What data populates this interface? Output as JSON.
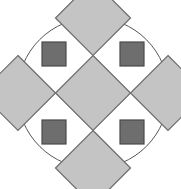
{
  "figure": {
    "title": "Geometric tile pattern",
    "description": "A circle containing five light gray diamonds arranged in a quincunx and four dark gray squares at the diagonal corners",
    "background_color": "#ffffff",
    "canvas": {
      "width": 181,
      "height": 189
    }
  },
  "palette": {
    "circle_stroke": "#555555",
    "circle_fill": "#ffffff",
    "diamond_fill": "#c4c4c4",
    "diamond_stroke": "#6b6b6b",
    "square_fill": "#6e6e6e",
    "square_stroke": "#4a4a4a"
  },
  "geometry": {
    "circle": {
      "cx": 93,
      "cy": 93,
      "r": 75.5,
      "stroke_width": 1
    },
    "diamond_half_diagonal": 37.5,
    "square_size": 24,
    "stroke_width": 1.2
  },
  "shapes": {
    "circle_label": "outer circle",
    "diamonds": [
      {
        "name": "center-diamond",
        "label": "center diamond",
        "cx": 93,
        "cy": 93
      },
      {
        "name": "top-diamond",
        "label": "top diamond",
        "cx": 93,
        "cy": 18
      },
      {
        "name": "right-diamond",
        "label": "right diamond",
        "cx": 168,
        "cy": 93
      },
      {
        "name": "bottom-diamond",
        "label": "bottom diamond",
        "cx": 93,
        "cy": 168
      },
      {
        "name": "left-diamond",
        "label": "left diamond",
        "cx": 18,
        "cy": 93
      }
    ],
    "squares": [
      {
        "name": "top-left-square",
        "label": "top left square",
        "x": 42,
        "y": 42
      },
      {
        "name": "top-right-square",
        "label": "top right square",
        "x": 120,
        "y": 42
      },
      {
        "name": "bottom-left-square",
        "label": "bottom left square",
        "x": 42,
        "y": 120
      },
      {
        "name": "bottom-right-square",
        "label": "bottom right square",
        "x": 120,
        "y": 120
      }
    ]
  },
  "chart_data": {
    "type": "diagram",
    "title": "Geometric tile pattern",
    "element_counts": {
      "circles": 1,
      "light_diamonds": 5,
      "dark_squares": 4
    },
    "legend": [
      {
        "swatch": "#c4c4c4",
        "label": "light gray diamond"
      },
      {
        "swatch": "#6e6e6e",
        "label": "dark gray square"
      }
    ]
  }
}
